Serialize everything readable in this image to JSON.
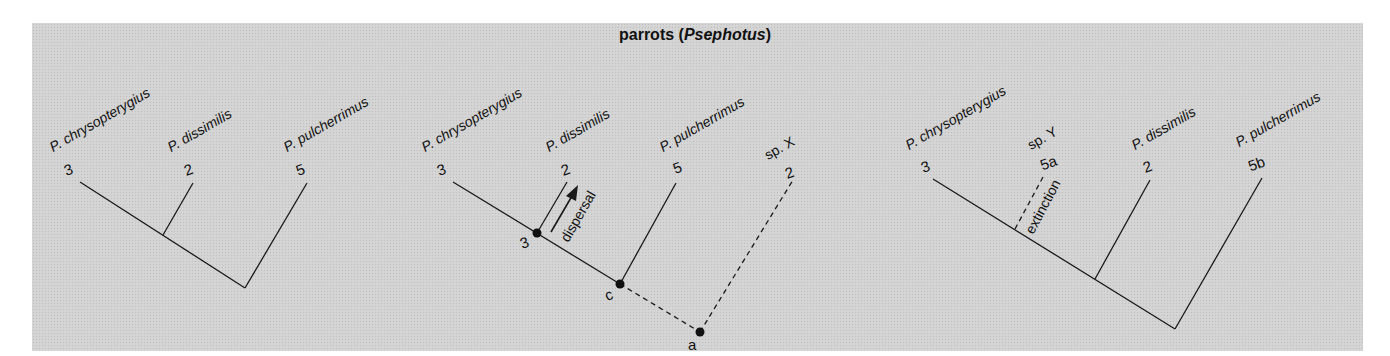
{
  "title": {
    "common": "parrots",
    "genus": "Psephotus",
    "open": " (",
    "close": ")"
  },
  "colors": {
    "background": "#d3d3d3",
    "line": "#1a1a1a",
    "page": "#ffffff"
  },
  "trees": [
    {
      "id": "tree-1-current",
      "taxa": [
        {
          "name": "P. chrysopterygius",
          "number": "3"
        },
        {
          "name": "P. dissimilis",
          "number": "2"
        },
        {
          "name": "P. pulcherrimus",
          "number": "5"
        }
      ]
    },
    {
      "id": "tree-2-dispersal",
      "taxa": [
        {
          "name": "P. chrysopterygius",
          "number": "3"
        },
        {
          "name": "P. dissimilis",
          "number": "2"
        },
        {
          "name": "P. pulcherrimus",
          "number": "5"
        },
        {
          "name": "sp. X",
          "number": "2"
        }
      ],
      "nodes": [
        {
          "label": "3"
        },
        {
          "label": "c"
        },
        {
          "label": "a"
        }
      ],
      "annotation": "dispersal"
    },
    {
      "id": "tree-3-extinction",
      "taxa": [
        {
          "name": "P. chrysopterygius",
          "number": "3"
        },
        {
          "name": "sp. Y",
          "number": "5a"
        },
        {
          "name": "P. dissimilis",
          "number": "2"
        },
        {
          "name": "P. pulcherrimus",
          "number": "5b"
        }
      ],
      "annotation": "extinction"
    }
  ]
}
